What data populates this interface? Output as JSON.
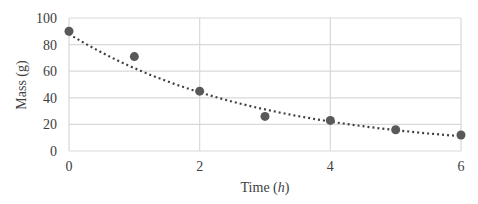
{
  "chart_data": {
    "type": "scatter",
    "title": "",
    "xlabel": "Time (h)",
    "xlabel_parts": {
      "prefix": "Time (",
      "var": "h",
      "suffix": ")"
    },
    "ylabel": "Mass (g)",
    "xlim": [
      0,
      6
    ],
    "ylim": [
      0,
      100
    ],
    "x_ticks": [
      0,
      2,
      4,
      6
    ],
    "y_ticks": [
      0,
      20,
      40,
      60,
      80,
      100
    ],
    "grid": true,
    "legend": null,
    "series": [
      {
        "name": "Mass",
        "x": [
          0,
          1,
          2,
          3,
          4,
          5,
          6
        ],
        "values": [
          90,
          71,
          45,
          26,
          23,
          16,
          12
        ]
      }
    ],
    "trendline": {
      "type": "exponential",
      "style": "dotted",
      "a": 88,
      "b": -0.345
    },
    "colors": {
      "marker": "#595959",
      "trendline": "#404040",
      "grid": "#d9d9d9",
      "text": "#404040"
    }
  }
}
